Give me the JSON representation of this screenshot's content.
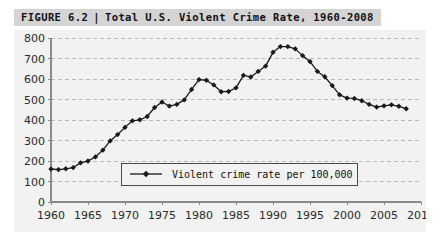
{
  "figure": {
    "label": "FIGURE 6.2",
    "separator": "|",
    "title": "Total U.S. Violent Crime Rate, 1960-2008"
  },
  "colors": {
    "header_band": "#d4d4d4",
    "plot_background": "#f2f2f2",
    "gridline": "#b9b9c4",
    "axis": "#8a8a8a",
    "series": "#1a1a1a",
    "page_background": "#ffffff"
  },
  "legend": {
    "position": "inside-bottom-center",
    "entries": [
      {
        "label": "Violent crime rate per 100,000",
        "marker": "line-with-diamond",
        "color": "#1a1a1a"
      }
    ]
  },
  "chart_data": {
    "type": "line",
    "title": "Total U.S. Violent Crime Rate, 1960-2008",
    "xlabel": "",
    "ylabel": "",
    "xlim": [
      1960,
      2010
    ],
    "ylim": [
      0,
      800
    ],
    "xticks": [
      1960,
      1965,
      1970,
      1975,
      1980,
      1985,
      1990,
      1995,
      2000,
      2005,
      2010
    ],
    "yticks": [
      0,
      100,
      200,
      300,
      400,
      500,
      600,
      700,
      800
    ],
    "grid": "horizontal-dashed",
    "legend_position": "inside-bottom-center",
    "series": [
      {
        "name": "Violent crime rate per 100,000",
        "color": "#1a1a1a",
        "marker": "diamond",
        "x": [
          1960,
          1961,
          1962,
          1963,
          1964,
          1965,
          1966,
          1967,
          1968,
          1969,
          1970,
          1971,
          1972,
          1973,
          1974,
          1975,
          1976,
          1977,
          1978,
          1979,
          1980,
          1981,
          1982,
          1983,
          1984,
          1985,
          1986,
          1987,
          1988,
          1989,
          1990,
          1991,
          1992,
          1993,
          1994,
          1995,
          1996,
          1997,
          1998,
          1999,
          2000,
          2001,
          2002,
          2003,
          2004,
          2005,
          2006,
          2007,
          2008
        ],
        "values": [
          161,
          158,
          162,
          168,
          191,
          200,
          220,
          253,
          298,
          329,
          364,
          396,
          401,
          417,
          461,
          488,
          468,
          476,
          498,
          549,
          597,
          594,
          571,
          538,
          539,
          557,
          618,
          610,
          637,
          663,
          730,
          758,
          758,
          747,
          714,
          685,
          637,
          611,
          568,
          523,
          507,
          505,
          494,
          476,
          463,
          469,
          474,
          467,
          455
        ]
      }
    ]
  }
}
